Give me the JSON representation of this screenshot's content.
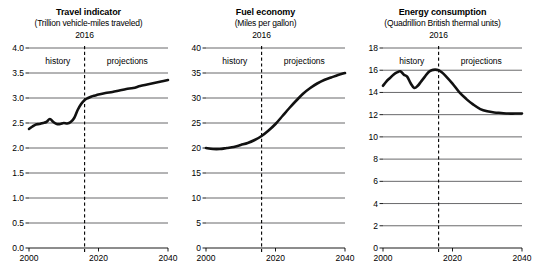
{
  "figure": {
    "x_axis": {
      "min": 2000,
      "max": 2040,
      "ticks": [
        2000,
        2020,
        2040
      ],
      "tick_labels": [
        "2000",
        "2020",
        "2040"
      ]
    },
    "divider_year": 2016,
    "divider_label": "2016",
    "phase_labels": {
      "left": "history",
      "right": "projections"
    }
  },
  "chart_data": [
    {
      "type": "line",
      "title": "Travel indicator",
      "subtitle": "(Trillion vehicle-miles traveled)",
      "xlabel": "",
      "ylabel": "",
      "xlim": [
        2000,
        2040
      ],
      "ylim": [
        0,
        4.0
      ],
      "ytick_labels": [
        "0.0",
        "0.5",
        "1.0",
        "1.5",
        "2.0",
        "2.5",
        "3.0",
        "3.5",
        "4.0"
      ],
      "yticks": [
        0,
        0.5,
        1.0,
        1.5,
        2.0,
        2.5,
        3.0,
        3.5,
        4.0
      ],
      "xtick_labels": [
        "2000",
        "2020",
        "2040"
      ],
      "grid": true,
      "legend": "none",
      "annotations": [
        "2016",
        "history",
        "projections"
      ],
      "x": [
        2000,
        2001,
        2002,
        2003,
        2004,
        2005,
        2006,
        2007,
        2008,
        2009,
        2010,
        2011,
        2012,
        2013,
        2014,
        2015,
        2016,
        2017,
        2018,
        2019,
        2020,
        2022,
        2024,
        2026,
        2028,
        2030,
        2032,
        2034,
        2036,
        2038,
        2040
      ],
      "values": [
        2.38,
        2.43,
        2.47,
        2.48,
        2.5,
        2.52,
        2.58,
        2.52,
        2.48,
        2.48,
        2.5,
        2.49,
        2.52,
        2.6,
        2.76,
        2.88,
        2.96,
        3.0,
        3.03,
        3.05,
        3.07,
        3.1,
        3.12,
        3.15,
        3.18,
        3.2,
        3.24,
        3.27,
        3.3,
        3.33,
        3.36
      ]
    },
    {
      "type": "line",
      "title": "Fuel economy",
      "subtitle": "(Miles per gallon)",
      "xlabel": "",
      "ylabel": "",
      "xlim": [
        2000,
        2040
      ],
      "ylim": [
        0,
        40
      ],
      "ytick_labels": [
        "0",
        "5",
        "10",
        "15",
        "20",
        "25",
        "30",
        "35",
        "40"
      ],
      "yticks": [
        0,
        5,
        10,
        15,
        20,
        25,
        30,
        35,
        40
      ],
      "xtick_labels": [
        "2000",
        "2020",
        "2040"
      ],
      "grid": true,
      "legend": "none",
      "annotations": [
        "2016",
        "history",
        "projections"
      ],
      "x": [
        2000,
        2002,
        2004,
        2006,
        2008,
        2010,
        2012,
        2014,
        2016,
        2018,
        2020,
        2022,
        2024,
        2026,
        2028,
        2030,
        2032,
        2034,
        2036,
        2038,
        2040
      ],
      "values": [
        20.0,
        19.8,
        19.8,
        20.0,
        20.2,
        20.6,
        21.0,
        21.6,
        22.4,
        23.5,
        24.8,
        26.4,
        28.0,
        29.5,
        30.9,
        32.0,
        32.9,
        33.6,
        34.1,
        34.6,
        35.0
      ]
    },
    {
      "type": "line",
      "title": "Energy consumption",
      "subtitle": "(Quadrillion British thermal units)",
      "xlabel": "",
      "ylabel": "",
      "xlim": [
        2000,
        2040
      ],
      "ylim": [
        0,
        18
      ],
      "ytick_labels": [
        "0",
        "2",
        "4",
        "6",
        "8",
        "10",
        "12",
        "14",
        "16",
        "18"
      ],
      "yticks": [
        0,
        2,
        4,
        6,
        8,
        10,
        12,
        14,
        16,
        18
      ],
      "xtick_labels": [
        "2000",
        "2020",
        "2040"
      ],
      "grid": true,
      "legend": "none",
      "annotations": [
        "2016",
        "history",
        "projections"
      ],
      "x": [
        2000,
        2001,
        2002,
        2003,
        2004,
        2005,
        2006,
        2007,
        2008,
        2009,
        2010,
        2011,
        2012,
        2013,
        2014,
        2015,
        2016,
        2017,
        2018,
        2020,
        2022,
        2024,
        2026,
        2028,
        2030,
        2032,
        2034,
        2036,
        2038,
        2040
      ],
      "values": [
        14.6,
        15.0,
        15.3,
        15.6,
        15.8,
        15.9,
        15.6,
        15.4,
        14.8,
        14.4,
        14.6,
        15.0,
        15.4,
        15.8,
        16.0,
        16.05,
        16.0,
        15.8,
        15.5,
        14.8,
        14.0,
        13.4,
        12.9,
        12.5,
        12.3,
        12.2,
        12.15,
        12.1,
        12.1,
        12.1
      ]
    }
  ]
}
